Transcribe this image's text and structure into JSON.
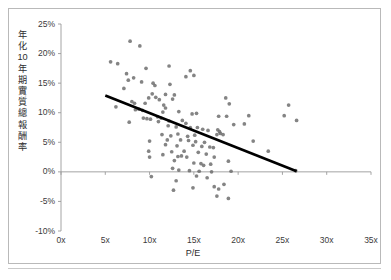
{
  "chart_data": {
    "type": "scatter",
    "title": "",
    "xlabel": "P/E",
    "ylabel": "年化10年期實質總報酬率",
    "xlim": [
      0,
      35
    ],
    "ylim": [
      -0.1,
      0.25
    ],
    "xticks": [
      "0x",
      "5x",
      "10x",
      "15x",
      "20x",
      "25x",
      "30x",
      "35x"
    ],
    "xtick_values": [
      0,
      5,
      10,
      15,
      20,
      25,
      30,
      35
    ],
    "yticks": [
      "25%",
      "20%",
      "15%",
      "10%",
      "5%",
      "0%",
      "-5%",
      "-10%"
    ],
    "ytick_values": [
      25,
      20,
      15,
      10,
      5,
      0,
      -5,
      -10
    ],
    "grid": false,
    "legend": null,
    "marker_color": "#6e6e6e",
    "trendline_color": "#000000",
    "axis_color": "#9a9a9a",
    "zero_line_value": 0,
    "trendline": {
      "type": "linear",
      "x_start": 5.0,
      "y_start": 12.9,
      "x_end": 26.6,
      "y_end": 0.1
    },
    "points": [
      [
        7.8,
        22.1
      ],
      [
        8.9,
        21.3
      ],
      [
        5.6,
        18.6
      ],
      [
        6.4,
        18.3
      ],
      [
        9.6,
        17.5
      ],
      [
        12.2,
        17.9
      ],
      [
        14.6,
        17.1
      ],
      [
        7.4,
        16.6
      ],
      [
        8.2,
        15.9
      ],
      [
        14.1,
        16.1
      ],
      [
        15.0,
        16.3
      ],
      [
        7.6,
        15.5
      ],
      [
        9.1,
        15.2
      ],
      [
        10.4,
        15.0
      ],
      [
        10.6,
        14.6
      ],
      [
        12.3,
        14.8
      ],
      [
        7.1,
        14.1
      ],
      [
        10.3,
        13.2
      ],
      [
        11.8,
        13.1
      ],
      [
        12.8,
        13.0
      ],
      [
        9.9,
        12.5
      ],
      [
        10.7,
        12.6
      ],
      [
        11.1,
        12.2
      ],
      [
        12.6,
        12.3
      ],
      [
        18.6,
        12.5
      ],
      [
        6.2,
        11.0
      ],
      [
        8.0,
        11.9
      ],
      [
        8.3,
        11.6
      ],
      [
        9.5,
        11.6
      ],
      [
        11.6,
        11.3
      ],
      [
        11.8,
        10.8
      ],
      [
        19.0,
        11.5
      ],
      [
        25.7,
        11.3
      ],
      [
        8.4,
        10.5
      ],
      [
        8.8,
        10.6
      ],
      [
        9.2,
        10.4
      ],
      [
        11.5,
        10.1
      ],
      [
        13.3,
        10.2
      ],
      [
        14.8,
        9.8
      ],
      [
        15.3,
        9.9
      ],
      [
        9.3,
        9.1
      ],
      [
        9.7,
        9.0
      ],
      [
        10.1,
        8.9
      ],
      [
        10.9,
        9.3
      ],
      [
        11.3,
        9.1
      ],
      [
        17.8,
        9.4
      ],
      [
        18.7,
        9.4
      ],
      [
        21.2,
        9.5
      ],
      [
        25.2,
        9.5
      ],
      [
        26.6,
        8.7
      ],
      [
        7.7,
        8.4
      ],
      [
        11.0,
        8.5
      ],
      [
        12.2,
        8.6
      ],
      [
        13.7,
        8.7
      ],
      [
        14.1,
        8.2
      ],
      [
        19.5,
        8.0
      ],
      [
        20.7,
        8.1
      ],
      [
        12.1,
        7.8
      ],
      [
        13.0,
        7.6
      ],
      [
        14.6,
        7.5
      ],
      [
        15.4,
        7.5
      ],
      [
        16.0,
        7.2
      ],
      [
        16.6,
        7.0
      ],
      [
        17.7,
        7.1
      ],
      [
        17.9,
        6.8
      ],
      [
        11.4,
        6.3
      ],
      [
        12.4,
        6.1
      ],
      [
        13.2,
        6.4
      ],
      [
        14.3,
        6.0
      ],
      [
        15.1,
        6.2
      ],
      [
        17.6,
        6.3
      ],
      [
        18.3,
        6.3
      ],
      [
        18.0,
        6.5
      ],
      [
        10.0,
        5.2
      ],
      [
        12.0,
        5.4
      ],
      [
        13.5,
        5.4
      ],
      [
        14.4,
        5.3
      ],
      [
        15.2,
        5.1
      ],
      [
        16.2,
        5.0
      ],
      [
        21.7,
        5.2
      ],
      [
        11.8,
        4.6
      ],
      [
        13.1,
        4.4
      ],
      [
        14.9,
        4.5
      ],
      [
        15.9,
        4.3
      ],
      [
        16.8,
        4.2
      ],
      [
        17.2,
        4.1
      ],
      [
        9.9,
        3.5
      ],
      [
        12.5,
        3.4
      ],
      [
        13.9,
        3.5
      ],
      [
        15.5,
        3.3
      ],
      [
        16.4,
        3.0
      ],
      [
        23.4,
        3.5
      ],
      [
        10.0,
        2.5
      ],
      [
        11.5,
        2.9
      ],
      [
        13.2,
        2.6
      ],
      [
        13.6,
        2.7
      ],
      [
        14.2,
        2.5
      ],
      [
        17.3,
        2.5
      ],
      [
        18.9,
        1.8
      ],
      [
        12.8,
        1.9
      ],
      [
        15.0,
        1.5
      ],
      [
        15.8,
        1.4
      ],
      [
        16.1,
        1.1
      ],
      [
        16.9,
        1.3
      ],
      [
        12.6,
        0.6
      ],
      [
        13.3,
        0.3
      ],
      [
        14.5,
        0.2
      ],
      [
        15.6,
        0.1
      ],
      [
        17.0,
        0.0
      ],
      [
        19.2,
        0.1
      ],
      [
        26.5,
        0.2
      ],
      [
        10.2,
        -0.8
      ],
      [
        13.0,
        -1.5
      ],
      [
        15.3,
        -0.7
      ],
      [
        16.5,
        -1.0
      ],
      [
        12.7,
        -3.1
      ],
      [
        14.9,
        -2.7
      ],
      [
        17.3,
        -2.5
      ],
      [
        17.8,
        -2.9
      ],
      [
        18.4,
        -2.1
      ],
      [
        17.6,
        -4.1
      ],
      [
        18.9,
        -4.5
      ]
    ]
  },
  "axis": {
    "x_title": "P/E",
    "y_title": "年化10年期實質總報酬率"
  },
  "caption": {
    "bottom_partial": ""
  }
}
